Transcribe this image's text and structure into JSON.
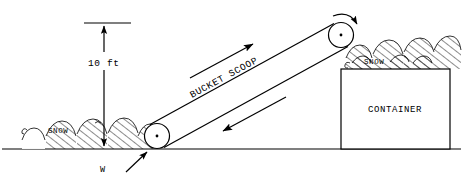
{
  "figure": {
    "canvas": {
      "width": 463,
      "height": 183
    },
    "background_color": "#ffffff",
    "line_color": "#000000"
  },
  "labels": {
    "height_dimension": "10 ft",
    "belt": "BUCKET  SCOOP",
    "container": "CONTAINER",
    "snow_ground": "SNOW",
    "snow_container": "SNOW",
    "load_force": "W"
  },
  "components": {
    "ground_line": {
      "name": "ground-line",
      "x1": 2,
      "y1": 149,
      "x2": 461,
      "y2": 149
    },
    "bottom_pulley": {
      "name": "bottom-pulley",
      "cx": 157,
      "cy": 136,
      "r": 12.5,
      "hub_r": 1.4
    },
    "top_pulley": {
      "name": "top-pulley",
      "cx": 341,
      "cy": 35,
      "r": 12.5,
      "hub_r": 1.4,
      "rotation": "clockwise"
    },
    "belt": {
      "name": "conveyor-belt",
      "angle_degrees": -28.5,
      "upper_run": {
        "x1": 150,
        "y1": 124,
        "x2": 334,
        "y2": 24
      },
      "lower_run": {
        "x1": 164,
        "y1": 147,
        "x2": 348,
        "y2": 47
      }
    },
    "container_box": {
      "name": "container-box",
      "x": 341,
      "y": 69,
      "width": 109,
      "height": 80
    },
    "dimension_line": {
      "name": "height-dimension",
      "x": 104,
      "y_top": 23,
      "y_bottom": 145,
      "tick_x1": 84,
      "tick_x2": 131,
      "tick_y": 23
    }
  },
  "arrows": {
    "belt_forward": {
      "name": "belt-direction-up-arrow",
      "x1": 190,
      "y1": 78,
      "x2": 255,
      "y2": 43,
      "direction": "up-right"
    },
    "belt_return": {
      "name": "belt-direction-down-arrow",
      "x1": 286,
      "y1": 97,
      "x2": 221,
      "y2": 132,
      "direction": "down-left"
    },
    "load_pointer": {
      "name": "load-force-arrow",
      "x1": 124,
      "y1": 172,
      "x2": 146,
      "y2": 151,
      "direction": "up-right"
    },
    "rotation": {
      "name": "pulley-rotation-arrow",
      "direction": "clockwise"
    }
  },
  "snow_piles": {
    "ground": {
      "name": "snow-pile-ground",
      "x_start": 20,
      "x_end": 150,
      "baseline_y": 149,
      "mound_count": 6
    },
    "container_top": {
      "name": "snow-pile-container",
      "x_start": 344,
      "x_end": 460,
      "baseline_y": 69,
      "mound_count": 7
    }
  }
}
